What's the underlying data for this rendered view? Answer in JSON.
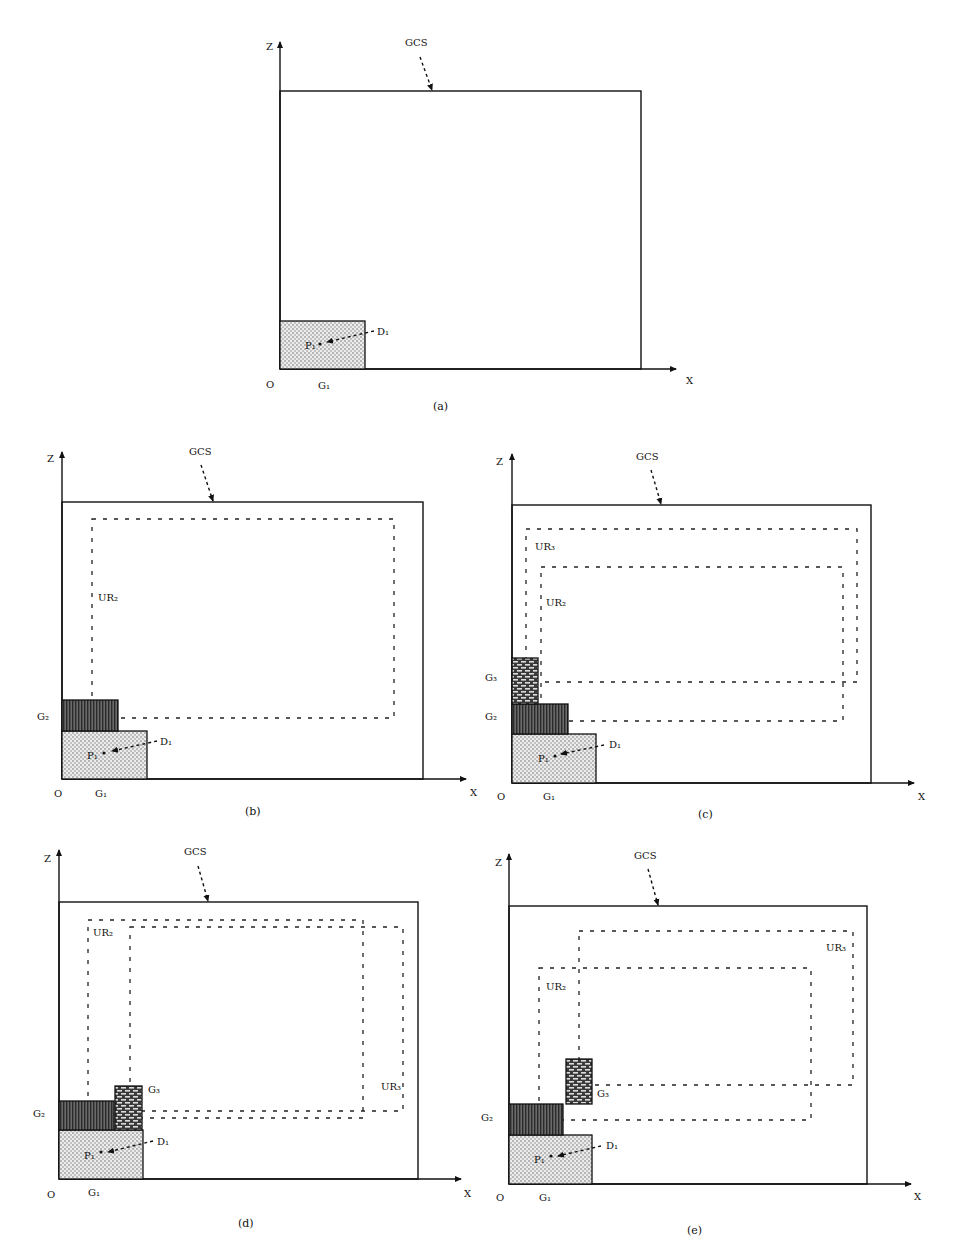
{
  "figure": {
    "labels": {
      "z_axis": "Z",
      "x_axis": "X",
      "origin": "O",
      "gcs": "GCS",
      "g1": "G₁",
      "g2": "G₂",
      "g3": "G₃",
      "d1": "D₁",
      "p1": "P₁",
      "ur2": "UR₂",
      "ur3": "UR₃"
    },
    "colors": {
      "line": "#111111",
      "g1_fill": "#e6e6e6",
      "g2_fill": "#555555",
      "g3_fill": "#777777"
    },
    "panels": [
      {
        "id": "a",
        "caption": "(a)",
        "caption_pos": [
          433,
          410
        ],
        "z_axis": {
          "x": 280,
          "top": 42,
          "bottom": 369,
          "label_pos": [
            266,
            50
          ]
        },
        "x_axis": {
          "y": 369,
          "left": 280,
          "right": 676,
          "label_pos": [
            686,
            384
          ]
        },
        "gcs_box": {
          "x1": 280,
          "y1": 91,
          "x2": 641,
          "y2": 369
        },
        "gcs_label": {
          "pos": [
            405,
            46
          ],
          "arrow_from": [
            420,
            57
          ],
          "arrow_to": [
            432,
            90
          ]
        },
        "origin_pos": [
          266,
          388
        ],
        "g1": {
          "x1": 280,
          "y1": 321,
          "x2": 365,
          "y2": 369,
          "label_pos": [
            318,
            389
          ]
        },
        "d1": {
          "label_pos": [
            377,
            335
          ],
          "arrow_from": [
            374,
            331
          ],
          "arrow_to": [
            327,
            342
          ]
        },
        "p1": {
          "label_pos": [
            305,
            349
          ],
          "dot": [
            320,
            344
          ]
        },
        "g2": null,
        "g3": null,
        "ur_rects": []
      },
      {
        "id": "b",
        "caption": "(b)",
        "caption_pos": [
          245,
          815
        ],
        "z_axis": {
          "x": 62,
          "top": 452,
          "bottom": 779,
          "label_pos": [
            47,
            462
          ]
        },
        "x_axis": {
          "y": 779,
          "left": 62,
          "right": 466,
          "label_pos": [
            470,
            796
          ]
        },
        "gcs_box": {
          "x1": 62,
          "y1": 502,
          "x2": 423,
          "y2": 779
        },
        "gcs_label": {
          "pos": [
            189,
            455
          ],
          "arrow_from": [
            201,
            465
          ],
          "arrow_to": [
            213,
            501
          ]
        },
        "origin_pos": [
          54,
          797
        ],
        "g1": {
          "x1": 62,
          "y1": 731,
          "x2": 147,
          "y2": 779,
          "label_pos": [
            95,
            797
          ]
        },
        "d1": {
          "label_pos": [
            160,
            745
          ],
          "arrow_from": [
            157,
            741
          ],
          "arrow_to": [
            112,
            751
          ]
        },
        "p1": {
          "label_pos": [
            87,
            759
          ],
          "dot": [
            104,
            753
          ]
        },
        "g2": {
          "x1": 62,
          "y1": 700,
          "x2": 118,
          "y2": 731,
          "label_pos": [
            37,
            720
          ]
        },
        "g3": null,
        "ur_rects": [
          {
            "name": "ur2",
            "x1": 92,
            "y1": 519,
            "x2": 394,
            "y2": 718,
            "label": "UR₂",
            "label_pos": [
              98,
              601
            ]
          }
        ]
      },
      {
        "id": "c",
        "caption": "(c)",
        "caption_pos": [
          698,
          818
        ],
        "z_axis": {
          "x": 512,
          "top": 454,
          "bottom": 783,
          "label_pos": [
            496,
            465
          ]
        },
        "x_axis": {
          "y": 783,
          "left": 512,
          "right": 914,
          "label_pos": [
            918,
            800
          ]
        },
        "gcs_label": {
          "pos": [
            636,
            460
          ],
          "arrow_from": [
            651,
            470
          ],
          "arrow_to": [
            661,
            504
          ]
        },
        "gcs_box": {
          "x1": 512,
          "y1": 505,
          "x2": 871,
          "y2": 783
        },
        "origin_pos": [
          497,
          800
        ],
        "g1": {
          "x1": 512,
          "y1": 734,
          "x2": 596,
          "y2": 783,
          "label_pos": [
            543,
            800
          ]
        },
        "d1": {
          "label_pos": [
            609,
            748
          ],
          "arrow_from": [
            604,
            745
          ],
          "arrow_to": [
            561,
            754
          ]
        },
        "p1": {
          "label_pos": [
            538,
            762
          ],
          "dot": [
            555,
            756
          ]
        },
        "g2": {
          "x1": 512,
          "y1": 704,
          "x2": 568,
          "y2": 734,
          "label_pos": [
            485,
            720
          ]
        },
        "g3": {
          "x1": 512,
          "y1": 658,
          "x2": 538,
          "y2": 704,
          "label_pos": [
            485,
            681
          ]
        },
        "ur_rects": [
          {
            "name": "ur3",
            "x1": 526,
            "y1": 529,
            "x2": 857,
            "y2": 682,
            "label": "UR₃",
            "label_pos": [
              535,
              550
            ]
          },
          {
            "name": "ur2",
            "x1": 541,
            "y1": 567,
            "x2": 843,
            "y2": 721,
            "label": "UR₂",
            "label_pos": [
              546,
              606
            ]
          }
        ]
      },
      {
        "id": "d",
        "caption": "(d)",
        "caption_pos": [
          238,
          1227
        ],
        "z_axis": {
          "x": 59,
          "top": 850,
          "bottom": 1179,
          "label_pos": [
            44,
            862
          ]
        },
        "x_axis": {
          "y": 1179,
          "left": 59,
          "right": 461,
          "label_pos": [
            464,
            1197
          ]
        },
        "gcs_box": {
          "x1": 59,
          "y1": 902,
          "x2": 418,
          "y2": 1179
        },
        "gcs_label": {
          "pos": [
            184,
            855
          ],
          "arrow_from": [
            198,
            866
          ],
          "arrow_to": [
            208,
            901
          ]
        },
        "origin_pos": [
          47,
          1198
        ],
        "g1": {
          "x1": 59,
          "y1": 1130,
          "x2": 143,
          "y2": 1179,
          "label_pos": [
            88,
            1196
          ]
        },
        "d1": {
          "label_pos": [
            157,
            1145
          ],
          "arrow_from": [
            153,
            1141
          ],
          "arrow_to": [
            108,
            1152
          ]
        },
        "p1": {
          "label_pos": [
            84,
            1159
          ],
          "dot": [
            101,
            1152
          ]
        },
        "g2": {
          "x1": 59,
          "y1": 1101,
          "x2": 114,
          "y2": 1130,
          "label_pos": [
            33,
            1117
          ]
        },
        "g3": {
          "x1": 115,
          "y1": 1086,
          "x2": 142,
          "y2": 1130,
          "label_pos": [
            148,
            1093
          ]
        },
        "ur_rects": [
          {
            "name": "ur2",
            "x1": 88,
            "y1": 920,
            "x2": 363,
            "y2": 1118,
            "label": "UR₂",
            "label_pos": [
              93,
              936
            ]
          },
          {
            "name": "ur3",
            "x1": 130,
            "y1": 927,
            "x2": 403,
            "y2": 1111,
            "label": "UR₃",
            "label_pos": [
              381,
              1090
            ]
          }
        ]
      },
      {
        "id": "e",
        "caption": "(e)",
        "caption_pos": [
          687,
          1234
        ],
        "z_axis": {
          "x": 509,
          "top": 854,
          "bottom": 1184,
          "label_pos": [
            495,
            866
          ]
        },
        "x_axis": {
          "y": 1184,
          "left": 509,
          "right": 911,
          "label_pos": [
            914,
            1200
          ]
        },
        "gcs_box": {
          "x1": 509,
          "y1": 906,
          "x2": 867,
          "y2": 1184
        },
        "gcs_label": {
          "pos": [
            634,
            859
          ],
          "arrow_from": [
            648,
            869
          ],
          "arrow_to": [
            658,
            905
          ]
        },
        "origin_pos": [
          496,
          1201
        ],
        "g1": {
          "x1": 509,
          "y1": 1135,
          "x2": 592,
          "y2": 1184,
          "label_pos": [
            539,
            1201
          ]
        },
        "d1": {
          "label_pos": [
            606,
            1149
          ],
          "arrow_from": [
            601,
            1146
          ],
          "arrow_to": [
            558,
            1156
          ]
        },
        "p1": {
          "label_pos": [
            534,
            1163
          ],
          "dot": [
            551,
            1156
          ]
        },
        "g2": {
          "x1": 509,
          "y1": 1104,
          "x2": 563,
          "y2": 1135,
          "label_pos": [
            481,
            1121
          ]
        },
        "g3": {
          "x1": 566,
          "y1": 1059,
          "x2": 592,
          "y2": 1104,
          "label_pos": [
            597,
            1097
          ]
        },
        "ur_rects": [
          {
            "name": "ur3",
            "x1": 579,
            "y1": 931,
            "x2": 853,
            "y2": 1085,
            "label": "UR₃",
            "label_pos": [
              826,
              951
            ]
          },
          {
            "name": "ur2",
            "x1": 539,
            "y1": 968,
            "x2": 811,
            "y2": 1120,
            "label": "UR₂",
            "label_pos": [
              546,
              990
            ]
          }
        ]
      }
    ]
  }
}
